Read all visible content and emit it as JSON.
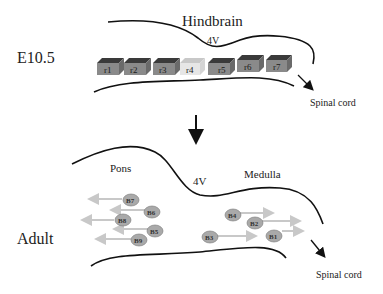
{
  "top_panel": {
    "stage_label": "E10.5",
    "region_title": "Hindbrain",
    "ventricle_label": "4V",
    "exit_label": "Spinal cord",
    "rhombomeres": [
      {
        "label": "r1",
        "highlight": false
      },
      {
        "label": "r2",
        "highlight": false
      },
      {
        "label": "r3",
        "highlight": false
      },
      {
        "label": "r4",
        "highlight": true
      },
      {
        "label": "r5",
        "highlight": false
      },
      {
        "label": "r6",
        "highlight": false
      },
      {
        "label": "r7",
        "highlight": false
      }
    ]
  },
  "transition_arrow": "down-arrow",
  "bottom_panel": {
    "stage_label": "Adult",
    "pons_label": "Pons",
    "ventricle_label": "4V",
    "medulla_label": "Medulla",
    "exit_label": "Spinal cord",
    "rostral_nuclei": [
      "B7",
      "B6",
      "B8",
      "B5",
      "B9"
    ],
    "caudal_nuclei": [
      "B4",
      "B2",
      "B3",
      "B1"
    ]
  },
  "colors": {
    "block_front": "#8a8a8a",
    "block_top": "#3a3a3a",
    "block_side": "#6a6a6a",
    "block_highlight_front": "#e6e6e6",
    "block_highlight_top": "#c8c8c8",
    "neuron_fill": "#a9a9a9",
    "projection_arrow": "#c8c8c8",
    "outline": "#111111"
  }
}
